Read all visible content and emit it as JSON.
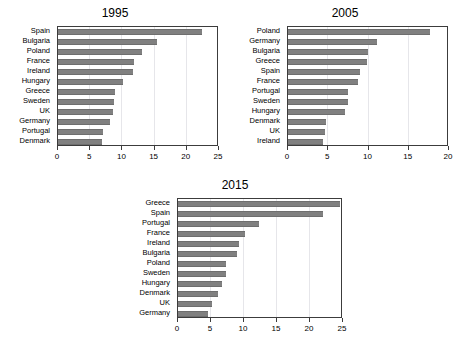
{
  "figure": {
    "background_color": "#ffffff",
    "bar_color": "#808080",
    "axis_color": "#3c3c3c",
    "gridline_color": "#e6e6ea"
  },
  "panels": [
    {
      "id": "panel-1995",
      "title": "1995"
    },
    {
      "id": "panel-2005",
      "title": "2005"
    },
    {
      "id": "panel-2015",
      "title": "2015"
    }
  ],
  "chart_data": [
    {
      "type": "bar",
      "orientation": "horizontal",
      "title": "1995",
      "xlabel": "",
      "ylabel": "",
      "xlim": [
        0,
        25
      ],
      "xticks": [
        0,
        5,
        10,
        15,
        20,
        25
      ],
      "xtick_labels": [
        "0",
        "5",
        "10",
        "15",
        "20",
        "25"
      ],
      "grid": true,
      "legend": false,
      "categories": [
        "Spain",
        "Bulgaria",
        "Poland",
        "France",
        "Ireland",
        "Hungary",
        "Greece",
        "Sweden",
        "UK",
        "Germany",
        "Portugal",
        "Denmark"
      ],
      "values": [
        22.4,
        15.3,
        13.1,
        11.8,
        11.7,
        10.1,
        8.9,
        8.7,
        8.6,
        8.0,
        7.0,
        6.9
      ]
    },
    {
      "type": "bar",
      "orientation": "horizontal",
      "title": "2005",
      "xlabel": "",
      "ylabel": "",
      "xlim": [
        0,
        20
      ],
      "xticks": [
        0,
        5,
        10,
        15,
        20
      ],
      "xtick_labels": [
        "0",
        "5",
        "10",
        "15",
        "20"
      ],
      "grid": true,
      "legend": false,
      "categories": [
        "Poland",
        "Germany",
        "Bulgaria",
        "Greece",
        "Spain",
        "France",
        "Portugal",
        "Sweden",
        "Hungary",
        "Denmark",
        "UK",
        "Ireland"
      ],
      "values": [
        17.6,
        11.0,
        9.9,
        9.8,
        8.9,
        8.7,
        7.4,
        7.4,
        7.1,
        4.7,
        4.6,
        4.3
      ]
    },
    {
      "type": "bar",
      "orientation": "horizontal",
      "title": "2015",
      "xlabel": "",
      "ylabel": "",
      "xlim": [
        0,
        25
      ],
      "xticks": [
        0,
        5,
        10,
        15,
        20,
        25
      ],
      "xtick_labels": [
        "0",
        "5",
        "10",
        "15",
        "20",
        "25"
      ],
      "grid": true,
      "legend": false,
      "categories": [
        "Greece",
        "Spain",
        "Portugal",
        "France",
        "Ireland",
        "Bulgaria",
        "Poland",
        "Sweden",
        "Hungary",
        "Denmark",
        "UK",
        "Germany"
      ],
      "values": [
        24.6,
        21.9,
        12.2,
        10.2,
        9.3,
        9.0,
        7.3,
        7.2,
        6.6,
        6.0,
        5.1,
        4.5
      ]
    }
  ]
}
